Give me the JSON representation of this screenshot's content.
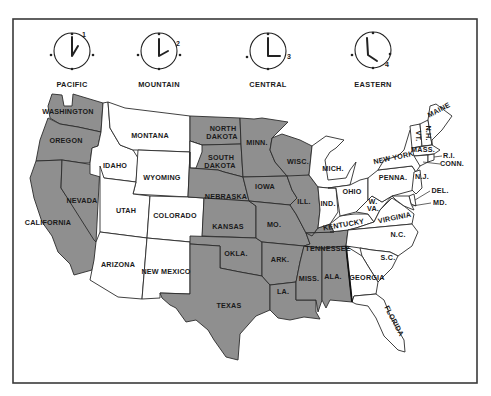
{
  "colors": {
    "shaded": "#8f8f8f",
    "plain": "#ffffff",
    "border": "#2b2b2b"
  },
  "time_zones": [
    {
      "name": "PACIFIC",
      "hour": 1,
      "clock_time": "1:00"
    },
    {
      "name": "MOUNTAIN",
      "hour": 2,
      "clock_time": "2:00"
    },
    {
      "name": "CENTRAL",
      "hour": 3,
      "clock_time": "3:00"
    },
    {
      "name": "EASTERN",
      "hour": 4,
      "clock_time": "4:00"
    }
  ],
  "states": {
    "washington": {
      "label": "WASHINGTON",
      "zone": "PACIFIC",
      "shaded": true
    },
    "oregon": {
      "label": "OREGON",
      "zone": "PACIFIC",
      "shaded": true
    },
    "california": {
      "label": "CALIFORNIA",
      "zone": "PACIFIC",
      "shaded": true
    },
    "nevada": {
      "label": "NEVADA",
      "zone": "PACIFIC",
      "shaded": true
    },
    "idaho": {
      "label": "IDAHO",
      "zone": "MOUNTAIN",
      "shaded": false
    },
    "montana": {
      "label": "MONTANA",
      "zone": "MOUNTAIN",
      "shaded": false
    },
    "wyoming": {
      "label": "WYOMING",
      "zone": "MOUNTAIN",
      "shaded": false
    },
    "utah": {
      "label": "UTAH",
      "zone": "MOUNTAIN",
      "shaded": false
    },
    "colorado": {
      "label": "COLORADO",
      "zone": "MOUNTAIN",
      "shaded": false
    },
    "arizona": {
      "label": "ARIZONA",
      "zone": "MOUNTAIN",
      "shaded": false
    },
    "new_mexico": {
      "label": "NEW MEXICO",
      "zone": "MOUNTAIN",
      "shaded": false
    },
    "north_dakota": {
      "label_1": "NORTH",
      "label_2": "DAKOTA",
      "zone": "CENTRAL",
      "shaded": true
    },
    "south_dakota": {
      "label_1": "SOUTH",
      "label_2": "DAKOTA",
      "zone": "CENTRAL",
      "shaded": true
    },
    "nebraska": {
      "label": "NEBRASKA",
      "zone": "CENTRAL",
      "shaded": true
    },
    "kansas": {
      "label": "KANSAS",
      "zone": "CENTRAL",
      "shaded": true
    },
    "oklahoma": {
      "label": "OKLA.",
      "zone": "CENTRAL",
      "shaded": true
    },
    "texas": {
      "label": "TEXAS",
      "zone": "CENTRAL",
      "shaded": true
    },
    "minnesota": {
      "label": "MINN.",
      "zone": "CENTRAL",
      "shaded": true
    },
    "iowa": {
      "label": "IOWA",
      "zone": "CENTRAL",
      "shaded": true
    },
    "missouri": {
      "label": "MO.",
      "zone": "CENTRAL",
      "shaded": true
    },
    "arkansas": {
      "label": "ARK.",
      "zone": "CENTRAL",
      "shaded": true
    },
    "louisiana": {
      "label": "LA.",
      "zone": "CENTRAL",
      "shaded": true
    },
    "wisconsin": {
      "label": "WISC.",
      "zone": "CENTRAL",
      "shaded": true
    },
    "illinois": {
      "label": "ILL.",
      "zone": "CENTRAL",
      "shaded": true
    },
    "mississippi": {
      "label": "MISS.",
      "zone": "CENTRAL",
      "shaded": true
    },
    "alabama": {
      "label": "ALA.",
      "zone": "CENTRAL",
      "shaded": true
    },
    "tennessee": {
      "label": "TENNESSEE",
      "zone": "CENTRAL",
      "shaded": true
    },
    "kentucky": {
      "label": "KENTUCKY",
      "zone": "EASTERN",
      "shaded": false
    },
    "michigan": {
      "label": "MICH.",
      "zone": "EASTERN",
      "shaded": false
    },
    "indiana": {
      "label": "IND.",
      "zone": "EASTERN",
      "shaded": false
    },
    "ohio": {
      "label": "OHIO",
      "zone": "EASTERN",
      "shaded": false
    },
    "west_virginia": {
      "label_1": "W.",
      "label_2": "VA.",
      "zone": "EASTERN",
      "shaded": false
    },
    "virginia": {
      "label": "VIRGINIA",
      "zone": "EASTERN",
      "shaded": false
    },
    "north_carolina": {
      "label": "N.C.",
      "zone": "EASTERN",
      "shaded": false
    },
    "south_carolina": {
      "label": "S.C.",
      "zone": "EASTERN",
      "shaded": false
    },
    "georgia": {
      "label": "GEORGIA",
      "zone": "EASTERN",
      "shaded": false
    },
    "florida": {
      "label": "FLORIDA",
      "zone": "EASTERN",
      "shaded": false
    },
    "pennsylvania": {
      "label": "PENNA.",
      "zone": "EASTERN",
      "shaded": false
    },
    "new_york": {
      "label": "NEW YORK",
      "zone": "EASTERN",
      "shaded": false
    },
    "new_jersey": {
      "label": "N.J.",
      "zone": "EASTERN",
      "shaded": false
    },
    "delaware": {
      "label": "DEL.",
      "zone": "EASTERN",
      "shaded": false
    },
    "maryland": {
      "label": "MD.",
      "zone": "EASTERN",
      "shaded": false
    },
    "vermont": {
      "label": "VT.",
      "zone": "EASTERN",
      "shaded": false
    },
    "new_hampshire": {
      "label": "N.H.",
      "zone": "EASTERN",
      "shaded": false
    },
    "maine": {
      "label": "MAINE",
      "zone": "EASTERN",
      "shaded": false
    },
    "massachusetts": {
      "label": "MASS.",
      "zone": "EASTERN",
      "shaded": false
    },
    "rhode_island": {
      "label": "R.I.",
      "zone": "EASTERN",
      "shaded": false
    },
    "connecticut": {
      "label": "CONN.",
      "zone": "EASTERN",
      "shaded": false
    }
  }
}
